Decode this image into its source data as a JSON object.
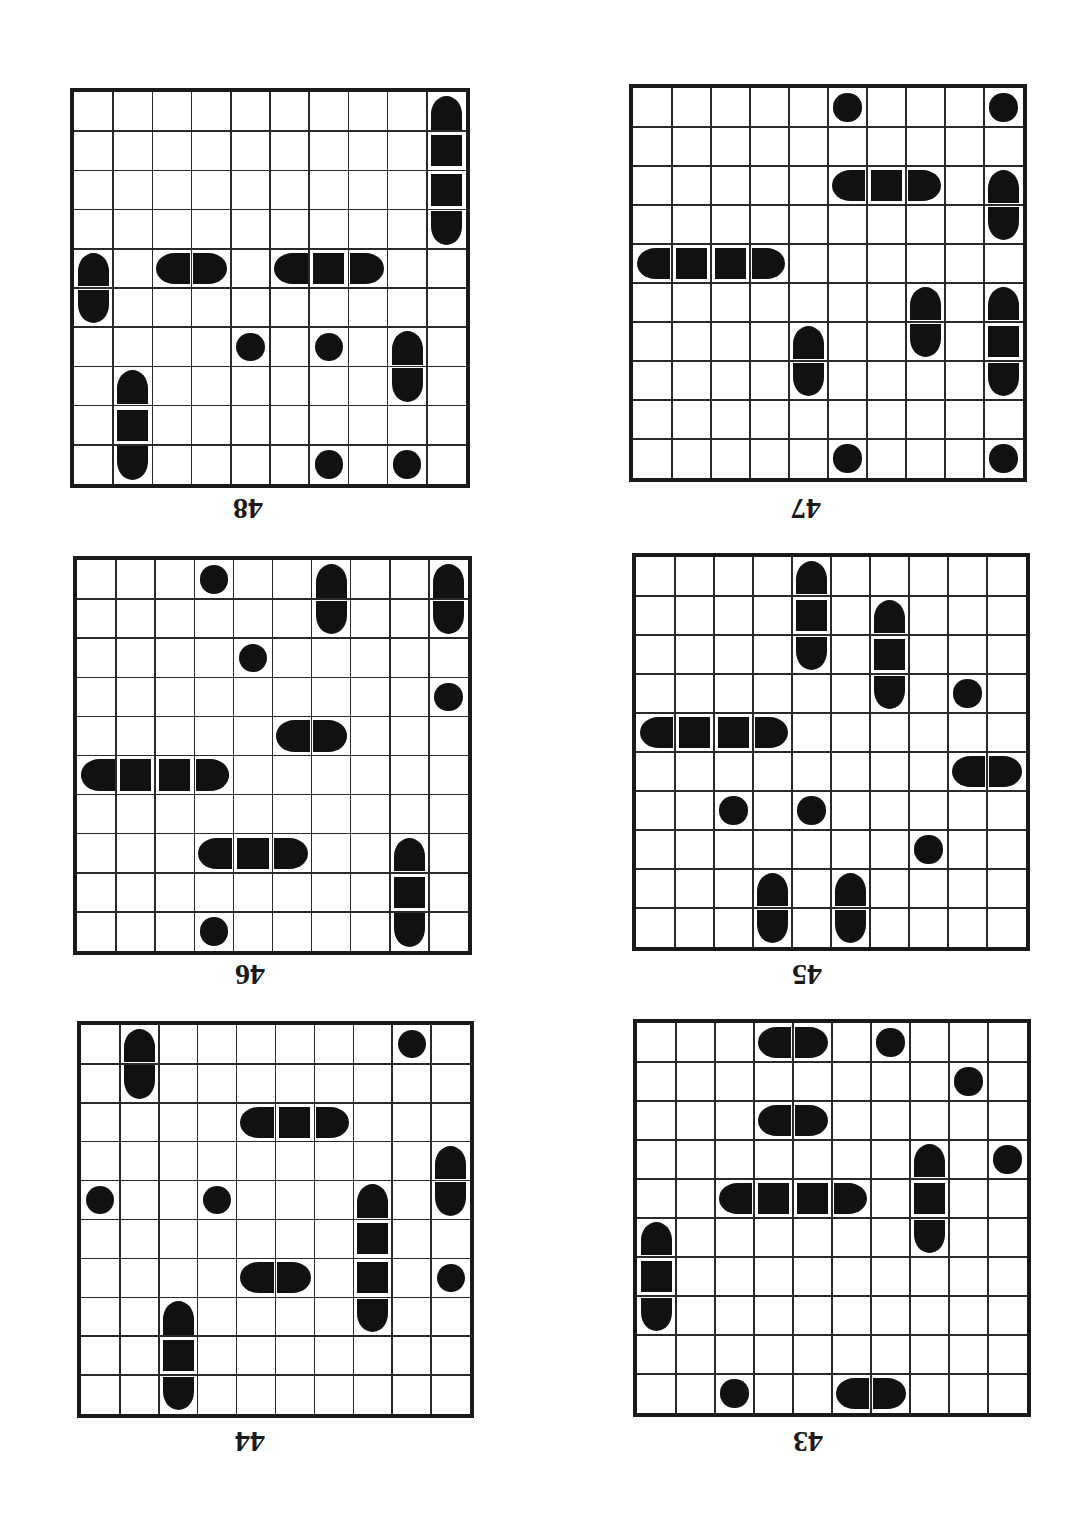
{
  "page": {
    "grid_size": 10,
    "colors": {
      "ink": "#111111",
      "grid_border": "#1a1a1a",
      "background": "#ffffff"
    }
  },
  "puzzles": [
    {
      "id": "48",
      "label": "48",
      "box": {
        "x": 70,
        "y": 88,
        "size": 400
      },
      "label_pos": {
        "x": 228,
        "y": 494
      },
      "pieces": [
        {
          "r": 0,
          "c": 9,
          "t": "T"
        },
        {
          "r": 1,
          "c": 9,
          "t": "M"
        },
        {
          "r": 2,
          "c": 9,
          "t": "M"
        },
        {
          "r": 3,
          "c": 9,
          "t": "B"
        },
        {
          "r": 4,
          "c": 0,
          "t": "T"
        },
        {
          "r": 5,
          "c": 0,
          "t": "B"
        },
        {
          "r": 4,
          "c": 2,
          "t": "L"
        },
        {
          "r": 4,
          "c": 3,
          "t": "R"
        },
        {
          "r": 4,
          "c": 5,
          "t": "L"
        },
        {
          "r": 4,
          "c": 6,
          "t": "M"
        },
        {
          "r": 4,
          "c": 7,
          "t": "R"
        },
        {
          "r": 6,
          "c": 4,
          "t": "D"
        },
        {
          "r": 6,
          "c": 6,
          "t": "D"
        },
        {
          "r": 6,
          "c": 8,
          "t": "T"
        },
        {
          "r": 7,
          "c": 8,
          "t": "B"
        },
        {
          "r": 7,
          "c": 1,
          "t": "T"
        },
        {
          "r": 8,
          "c": 1,
          "t": "M"
        },
        {
          "r": 9,
          "c": 1,
          "t": "B"
        },
        {
          "r": 9,
          "c": 6,
          "t": "D"
        },
        {
          "r": 9,
          "c": 8,
          "t": "D"
        }
      ]
    },
    {
      "id": "47",
      "label": "47",
      "box": {
        "x": 629,
        "y": 84,
        "size": 398
      },
      "label_pos": {
        "x": 786,
        "y": 494
      },
      "pieces": [
        {
          "r": 0,
          "c": 5,
          "t": "D"
        },
        {
          "r": 0,
          "c": 9,
          "t": "D"
        },
        {
          "r": 2,
          "c": 5,
          "t": "L"
        },
        {
          "r": 2,
          "c": 6,
          "t": "M"
        },
        {
          "r": 2,
          "c": 7,
          "t": "R"
        },
        {
          "r": 2,
          "c": 9,
          "t": "T"
        },
        {
          "r": 3,
          "c": 9,
          "t": "B"
        },
        {
          "r": 4,
          "c": 0,
          "t": "L"
        },
        {
          "r": 4,
          "c": 1,
          "t": "M"
        },
        {
          "r": 4,
          "c": 2,
          "t": "M"
        },
        {
          "r": 4,
          "c": 3,
          "t": "R"
        },
        {
          "r": 5,
          "c": 7,
          "t": "T"
        },
        {
          "r": 6,
          "c": 7,
          "t": "B"
        },
        {
          "r": 5,
          "c": 9,
          "t": "T"
        },
        {
          "r": 6,
          "c": 9,
          "t": "M"
        },
        {
          "r": 7,
          "c": 9,
          "t": "B"
        },
        {
          "r": 6,
          "c": 4,
          "t": "T"
        },
        {
          "r": 7,
          "c": 4,
          "t": "B"
        },
        {
          "r": 9,
          "c": 5,
          "t": "D"
        },
        {
          "r": 9,
          "c": 9,
          "t": "D"
        }
      ]
    },
    {
      "id": "46",
      "label": "46",
      "box": {
        "x": 73,
        "y": 556,
        "size": 399
      },
      "label_pos": {
        "x": 230,
        "y": 960
      },
      "pieces": [
        {
          "r": 0,
          "c": 3,
          "t": "D"
        },
        {
          "r": 0,
          "c": 6,
          "t": "T"
        },
        {
          "r": 1,
          "c": 6,
          "t": "B"
        },
        {
          "r": 0,
          "c": 9,
          "t": "T"
        },
        {
          "r": 1,
          "c": 9,
          "t": "B"
        },
        {
          "r": 2,
          "c": 4,
          "t": "D"
        },
        {
          "r": 3,
          "c": 9,
          "t": "D"
        },
        {
          "r": 4,
          "c": 5,
          "t": "L"
        },
        {
          "r": 4,
          "c": 6,
          "t": "R"
        },
        {
          "r": 5,
          "c": 0,
          "t": "L"
        },
        {
          "r": 5,
          "c": 1,
          "t": "M"
        },
        {
          "r": 5,
          "c": 2,
          "t": "M"
        },
        {
          "r": 5,
          "c": 3,
          "t": "R"
        },
        {
          "r": 7,
          "c": 3,
          "t": "L"
        },
        {
          "r": 7,
          "c": 4,
          "t": "M"
        },
        {
          "r": 7,
          "c": 5,
          "t": "R"
        },
        {
          "r": 7,
          "c": 8,
          "t": "T"
        },
        {
          "r": 8,
          "c": 8,
          "t": "M"
        },
        {
          "r": 9,
          "c": 8,
          "t": "B"
        },
        {
          "r": 9,
          "c": 3,
          "t": "D"
        }
      ]
    },
    {
      "id": "45",
      "label": "45",
      "box": {
        "x": 632,
        "y": 553,
        "size": 398
      },
      "label_pos": {
        "x": 787,
        "y": 960
      },
      "pieces": [
        {
          "r": 0,
          "c": 4,
          "t": "T"
        },
        {
          "r": 1,
          "c": 4,
          "t": "M"
        },
        {
          "r": 2,
          "c": 4,
          "t": "B"
        },
        {
          "r": 1,
          "c": 6,
          "t": "T"
        },
        {
          "r": 2,
          "c": 6,
          "t": "M"
        },
        {
          "r": 3,
          "c": 6,
          "t": "B"
        },
        {
          "r": 3,
          "c": 8,
          "t": "D"
        },
        {
          "r": 4,
          "c": 0,
          "t": "L"
        },
        {
          "r": 4,
          "c": 1,
          "t": "M"
        },
        {
          "r": 4,
          "c": 2,
          "t": "M"
        },
        {
          "r": 4,
          "c": 3,
          "t": "R"
        },
        {
          "r": 5,
          "c": 8,
          "t": "L"
        },
        {
          "r": 5,
          "c": 9,
          "t": "R"
        },
        {
          "r": 6,
          "c": 2,
          "t": "D"
        },
        {
          "r": 6,
          "c": 4,
          "t": "D"
        },
        {
          "r": 7,
          "c": 7,
          "t": "D"
        },
        {
          "r": 8,
          "c": 3,
          "t": "T"
        },
        {
          "r": 9,
          "c": 3,
          "t": "B"
        },
        {
          "r": 8,
          "c": 5,
          "t": "T"
        },
        {
          "r": 9,
          "c": 5,
          "t": "B"
        }
      ]
    },
    {
      "id": "44",
      "label": "44",
      "box": {
        "x": 77,
        "y": 1021,
        "size": 397
      },
      "label_pos": {
        "x": 230,
        "y": 1427
      },
      "pieces": [
        {
          "r": 0,
          "c": 1,
          "t": "T"
        },
        {
          "r": 1,
          "c": 1,
          "t": "B"
        },
        {
          "r": 0,
          "c": 8,
          "t": "D"
        },
        {
          "r": 2,
          "c": 4,
          "t": "L"
        },
        {
          "r": 2,
          "c": 5,
          "t": "M"
        },
        {
          "r": 2,
          "c": 6,
          "t": "R"
        },
        {
          "r": 3,
          "c": 9,
          "t": "T"
        },
        {
          "r": 4,
          "c": 9,
          "t": "B"
        },
        {
          "r": 4,
          "c": 0,
          "t": "D"
        },
        {
          "r": 4,
          "c": 3,
          "t": "D"
        },
        {
          "r": 4,
          "c": 7,
          "t": "T"
        },
        {
          "r": 5,
          "c": 7,
          "t": "M"
        },
        {
          "r": 6,
          "c": 7,
          "t": "M"
        },
        {
          "r": 7,
          "c": 7,
          "t": "B"
        },
        {
          "r": 6,
          "c": 4,
          "t": "L"
        },
        {
          "r": 6,
          "c": 5,
          "t": "R"
        },
        {
          "r": 6,
          "c": 9,
          "t": "D"
        },
        {
          "r": 7,
          "c": 2,
          "t": "T"
        },
        {
          "r": 8,
          "c": 2,
          "t": "M"
        },
        {
          "r": 9,
          "c": 2,
          "t": "B"
        }
      ]
    },
    {
      "id": "43",
      "label": "43",
      "box": {
        "x": 633,
        "y": 1019,
        "size": 398
      },
      "label_pos": {
        "x": 788,
        "y": 1427
      },
      "pieces": [
        {
          "r": 0,
          "c": 3,
          "t": "L"
        },
        {
          "r": 0,
          "c": 4,
          "t": "R"
        },
        {
          "r": 0,
          "c": 6,
          "t": "D"
        },
        {
          "r": 1,
          "c": 8,
          "t": "D"
        },
        {
          "r": 2,
          "c": 3,
          "t": "L"
        },
        {
          "r": 2,
          "c": 4,
          "t": "R"
        },
        {
          "r": 3,
          "c": 7,
          "t": "T"
        },
        {
          "r": 4,
          "c": 7,
          "t": "M"
        },
        {
          "r": 5,
          "c": 7,
          "t": "B"
        },
        {
          "r": 3,
          "c": 9,
          "t": "D"
        },
        {
          "r": 4,
          "c": 2,
          "t": "L"
        },
        {
          "r": 4,
          "c": 3,
          "t": "M"
        },
        {
          "r": 4,
          "c": 4,
          "t": "M"
        },
        {
          "r": 4,
          "c": 5,
          "t": "R"
        },
        {
          "r": 5,
          "c": 0,
          "t": "T"
        },
        {
          "r": 6,
          "c": 0,
          "t": "M"
        },
        {
          "r": 7,
          "c": 0,
          "t": "B"
        },
        {
          "r": 9,
          "c": 2,
          "t": "D"
        },
        {
          "r": 9,
          "c": 5,
          "t": "L"
        },
        {
          "r": 9,
          "c": 6,
          "t": "R"
        }
      ]
    }
  ]
}
